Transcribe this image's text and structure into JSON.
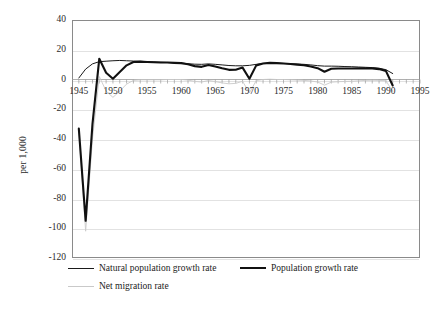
{
  "chart_data": {
    "type": "line",
    "title": "",
    "xlabel": "",
    "ylabel": "per 1,000",
    "xlim": [
      1944,
      1995
    ],
    "ylim": [
      -120,
      40
    ],
    "ytick_labels": [
      "40",
      "20",
      "0",
      "-20",
      "-40",
      "-60",
      "-80",
      "-100",
      "-120"
    ],
    "ytick_values": [
      40,
      20,
      0,
      -20,
      -40,
      -60,
      -80,
      -100,
      -120
    ],
    "xtick_labels": [
      "1945",
      "1950",
      "1955",
      "1960",
      "1965",
      "1970",
      "1975",
      "1980",
      "1985",
      "1990",
      "1995"
    ],
    "xtick_values": [
      1945,
      1950,
      1955,
      1960,
      1965,
      1970,
      1975,
      1980,
      1985,
      1990,
      1995
    ],
    "grid": true,
    "legend_position": "below",
    "series": [
      {
        "name": "Natural population growth rate",
        "style": "thin",
        "color": "#1a1a1a",
        "x": [
          1945,
          1946,
          1947,
          1948,
          1949,
          1950,
          1951,
          1952,
          1953,
          1954,
          1955,
          1956,
          1957,
          1958,
          1959,
          1960,
          1961,
          1962,
          1963,
          1964,
          1965,
          1966,
          1967,
          1968,
          1969,
          1970,
          1971,
          1972,
          1973,
          1974,
          1975,
          1976,
          1977,
          1978,
          1979,
          1980,
          1981,
          1982,
          1983,
          1984,
          1985,
          1986,
          1987,
          1988,
          1989,
          1990,
          1991
        ],
        "values": [
          1.0,
          7.0,
          10.5,
          12.0,
          12.3,
          12.6,
          12.8,
          12.6,
          12.4,
          12.2,
          12.0,
          11.8,
          11.6,
          11.4,
          11.2,
          11.0,
          10.6,
          10.3,
          10.2,
          10.5,
          10.2,
          9.8,
          9.4,
          9.2,
          9.2,
          9.5,
          10.2,
          10.8,
          11.0,
          11.0,
          10.8,
          10.6,
          10.4,
          10.2,
          9.8,
          9.3,
          9.0,
          9.0,
          8.9,
          8.7,
          8.6,
          8.4,
          8.2,
          8.0,
          7.6,
          6.6,
          4.0
        ]
      },
      {
        "name": "Population growth rate",
        "style": "thick",
        "color": "#111111",
        "x": [
          1945,
          1946,
          1947,
          1948,
          1949,
          1950,
          1951,
          1952,
          1953,
          1954,
          1955,
          1956,
          1957,
          1958,
          1959,
          1960,
          1961,
          1962,
          1963,
          1964,
          1965,
          1966,
          1967,
          1968,
          1969,
          1970,
          1971,
          1972,
          1973,
          1974,
          1975,
          1976,
          1977,
          1978,
          1979,
          1980,
          1981,
          1982,
          1983,
          1984,
          1985,
          1986,
          1987,
          1988,
          1989,
          1990,
          1991
        ],
        "values": [
          -33.0,
          -95.0,
          -30.0,
          14.0,
          4.5,
          0.5,
          5.0,
          9.5,
          11.8,
          12.0,
          11.8,
          11.6,
          11.4,
          11.4,
          11.2,
          11.0,
          10.2,
          9.0,
          8.5,
          9.8,
          8.8,
          7.5,
          6.5,
          6.6,
          8.0,
          0.5,
          9.5,
          10.8,
          11.2,
          11.0,
          10.8,
          10.4,
          10.0,
          9.6,
          8.8,
          7.6,
          5.2,
          7.2,
          7.4,
          7.4,
          7.4,
          7.5,
          7.6,
          7.5,
          7.0,
          5.8,
          -4.0
        ]
      },
      {
        "name": "Net migration rate",
        "style": "dotted",
        "color": "#c9c9c9",
        "x": [
          1945,
          1946,
          1947,
          1948,
          1949,
          1950,
          1951,
          1952,
          1953,
          1954,
          1955,
          1956,
          1957,
          1958,
          1959,
          1960,
          1961,
          1962,
          1963,
          1964,
          1965,
          1966,
          1967,
          1968,
          1969,
          1970,
          1971,
          1972,
          1973,
          1974,
          1975,
          1976,
          1977,
          1978,
          1979,
          1980,
          1981,
          1982,
          1983,
          1984,
          1985,
          1986,
          1987,
          1988,
          1989,
          1990,
          1991
        ],
        "values": [
          -34.0,
          -102.0,
          -40.0,
          2.0,
          -7.8,
          -12.0,
          -7.8,
          -3.1,
          -0.6,
          -0.2,
          -0.2,
          -0.2,
          -0.2,
          0.0,
          0.0,
          0.0,
          -0.4,
          -1.3,
          -1.7,
          -0.7,
          -1.4,
          -2.3,
          -2.9,
          -2.6,
          -1.2,
          -9.0,
          -0.7,
          0.0,
          0.2,
          0.0,
          0.0,
          -0.2,
          -0.4,
          -0.6,
          -1.0,
          -1.7,
          -3.8,
          -1.8,
          -1.5,
          -1.3,
          -1.2,
          -0.9,
          -0.6,
          -0.5,
          -0.6,
          -0.8,
          -8.0
        ]
      }
    ]
  },
  "legend": {
    "entries": [
      {
        "label": "Natural population growth rate",
        "style": "thin"
      },
      {
        "label": "Population growth rate",
        "style": "thick"
      },
      {
        "label": "Net migration rate",
        "style": "dotted"
      }
    ]
  },
  "axis": {
    "y_title": "per 1,000"
  }
}
